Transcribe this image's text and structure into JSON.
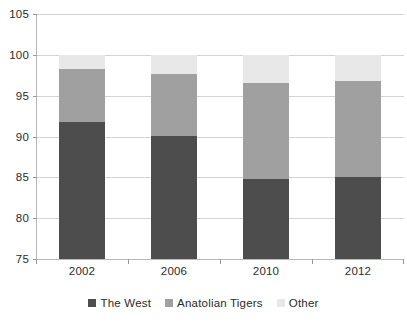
{
  "chart_data": {
    "type": "bar",
    "stacked": true,
    "title": "",
    "subtitle": "",
    "xlabel": "",
    "ylabel": "",
    "categories": [
      "2002",
      "2006",
      "2010",
      "2012"
    ],
    "series": [
      {
        "name": "The West",
        "color": "#4d4d4d",
        "values": [
          91.8,
          90.1,
          84.8,
          85.1
        ]
      },
      {
        "name": "Anatolian Tigers",
        "color": "#a0a0a0",
        "values": [
          6.5,
          7.5,
          11.7,
          11.7
        ]
      },
      {
        "name": "Other",
        "color": "#e8e8e8",
        "values": [
          1.7,
          2.4,
          3.5,
          3.2
        ]
      }
    ],
    "cumulative_tops": {
      "the_west": [
        91.8,
        90.1,
        84.8,
        85.1
      ],
      "the_west_plus_anatolian_tigers": [
        98.3,
        97.6,
        96.5,
        96.8
      ],
      "total": [
        100,
        100,
        100,
        100
      ]
    },
    "ylim": [
      75,
      105
    ],
    "ytick_step": 5,
    "ytick_labels": [
      "105",
      "100",
      "95",
      "90",
      "85",
      "80",
      "75"
    ],
    "ytick_values": [
      105,
      100,
      95,
      90,
      85,
      80,
      75
    ],
    "grid": true,
    "grid_axis": "y",
    "legend": {
      "position": "bottom",
      "orientation": "horizontal",
      "entries": [
        {
          "label": "The West",
          "color": "#4d4d4d"
        },
        {
          "label": "Anatolian Tigers",
          "color": "#a0a0a0"
        },
        {
          "label": "Other",
          "color": "#e8e8e8"
        }
      ]
    },
    "colors": {
      "plot_background": "#ffffff",
      "gridline": "#d4d4d4",
      "axis_line": "#b8b8b8",
      "text": "#2b2b2b"
    }
  }
}
